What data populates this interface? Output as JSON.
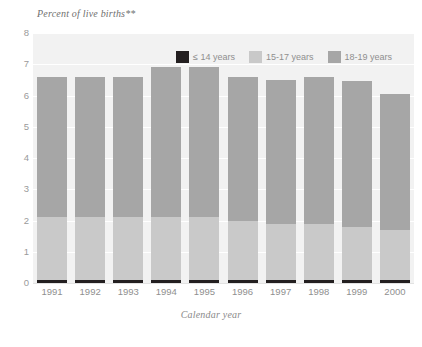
{
  "chart_data": {
    "type": "bar",
    "stacked": true,
    "title": "",
    "ylabel": "Percent of live births**",
    "xlabel": "Calendar year",
    "categories": [
      "1991",
      "1992",
      "1993",
      "1994",
      "1995",
      "1996",
      "1997",
      "1998",
      "1999",
      "2000"
    ],
    "ylim": [
      0,
      8
    ],
    "yticks": [
      0,
      1,
      2,
      3,
      4,
      5,
      6,
      7,
      8
    ],
    "ytick_labels": [
      "0",
      "1",
      "2",
      "3",
      "4",
      "5",
      "6",
      "7",
      "8"
    ],
    "grid": true,
    "legend_position": "top-right",
    "series": [
      {
        "name": "≤ 14 years",
        "color": "#231f20",
        "values": [
          0.1,
          0.1,
          0.1,
          0.1,
          0.1,
          0.1,
          0.1,
          0.1,
          0.1,
          0.1
        ]
      },
      {
        "name": "15-17 years",
        "color": "#c9c9c9",
        "values": [
          2.0,
          2.0,
          2.0,
          2.0,
          2.0,
          1.9,
          1.8,
          1.8,
          1.7,
          1.6
        ]
      },
      {
        "name": "18-19 years",
        "color": "#a6a6a6",
        "values": [
          4.5,
          4.5,
          4.5,
          4.8,
          4.8,
          4.6,
          4.6,
          4.7,
          4.65,
          4.35
        ]
      }
    ],
    "totals": [
      6.6,
      6.6,
      6.6,
      6.9,
      6.9,
      6.6,
      6.5,
      6.6,
      6.45,
      6.05
    ]
  },
  "legend": {
    "items": [
      {
        "label": "≤ 14 years",
        "swatch": "dark-swatch"
      },
      {
        "label": "15-17 years",
        "swatch": "light-gray-swatch"
      },
      {
        "label": "18-19 years",
        "swatch": "medium-gray-swatch"
      }
    ]
  },
  "axes": {
    "y_title": "Percent of live births**",
    "x_title": "Calendar year"
  },
  "colors": {
    "plot_background": "#f2f2f2",
    "page_background": "#ffffff",
    "gridline": "#ffffff",
    "series_le14": "#231f20",
    "series_15_17": "#c9c9c9",
    "series_18_19": "#a6a6a6",
    "tick_text": "#8f8f8f",
    "title_text": "#6f6f6f"
  }
}
